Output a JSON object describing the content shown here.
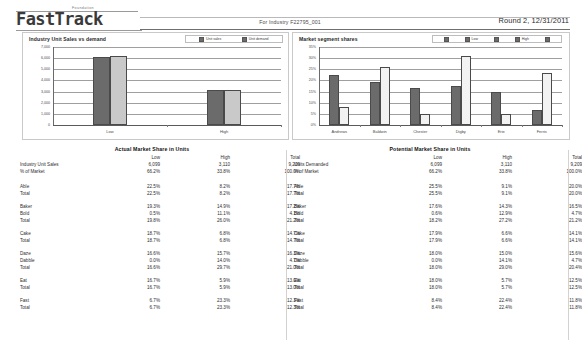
{
  "header": {
    "logo_superscript": "Foundation",
    "logo": "FastTrack",
    "industry": "For Industry F22795_001",
    "round": "Round 2, 12/31/2011"
  },
  "charts": {
    "left": {
      "title": "Industry Unit Sales vs demand",
      "legend": [
        {
          "label": "Unit sales",
          "color": "#6b6b6b"
        },
        {
          "label": "Unit demand",
          "color": "#c9c9c9"
        }
      ]
    },
    "right": {
      "title": "Market segment shares",
      "legend": [
        {
          "label": "",
          "color": "#6b6b6b"
        },
        {
          "label": "Low",
          "color": "#6b6b6b"
        },
        {
          "label": "",
          "color": "#f2f2f2"
        },
        {
          "label": "High",
          "color": "#f2f2f2"
        },
        {
          "label": "",
          "color": "#ffffff"
        }
      ]
    }
  },
  "chart_data": [
    {
      "type": "bar",
      "title": "Industry Unit Sales vs demand",
      "categories": [
        "Low",
        "High"
      ],
      "series": [
        {
          "name": "Unit sales",
          "values": [
            6099,
            3110
          ],
          "color": "#6b6b6b"
        },
        {
          "name": "Unit demand",
          "values": [
            6150,
            3130
          ],
          "color": "#c9c9c9"
        }
      ],
      "xlabel": "",
      "ylabel": "",
      "ylim": [
        0,
        7000
      ],
      "yticks": [
        "7,000",
        "6,000",
        "5,000",
        "4,000",
        "3,000",
        "2,000",
        "1,000",
        "0"
      ],
      "grid": true,
      "legend_position": "top-right"
    },
    {
      "type": "bar",
      "title": "Market segment shares",
      "categories": [
        "Andrews",
        "Baldwin",
        "Chester",
        "Digby",
        "Erie",
        "Ferris"
      ],
      "series": [
        {
          "name": "Low",
          "values": [
            22.5,
            19.3,
            16.7,
            17.6,
            15.0,
            6.7
          ],
          "color": "#6b6b6b"
        },
        {
          "name": "High",
          "values": [
            8.2,
            26.0,
            5.0,
            31.0,
            4.9,
            23.3
          ],
          "color": "#f2f2f2"
        }
      ],
      "xlabel": "",
      "ylabel": "",
      "ylim": [
        0,
        35
      ],
      "yticks": [
        "35%",
        "30%",
        "25%",
        "20%",
        "15%",
        "10%",
        "5%",
        "0%"
      ],
      "grid": true,
      "legend_position": "top-right"
    }
  ],
  "tables": {
    "actual": {
      "title": "Actual Market Share in Units",
      "columns": [
        "",
        "Low",
        "High",
        "Total"
      ],
      "summary": [
        {
          "label": "Industry Unit Sales",
          "low": "6,099",
          "high": "3,110",
          "total": "9,209"
        },
        {
          "label": "% of Market",
          "low": "66.2%",
          "high": "33.8%",
          "total": "100.0%"
        }
      ],
      "groups": [
        {
          "rows": [
            {
              "label": "Able",
              "low": "22.5%",
              "high": "8.2%",
              "total": "17.7%"
            },
            {
              "label": "Total",
              "low": "22.5%",
              "high": "8.2%",
              "total": "17.7%"
            }
          ]
        },
        {
          "rows": [
            {
              "label": "Baker",
              "low": "19.3%",
              "high": "14.9%",
              "total": "17.2%"
            },
            {
              "label": "Bold",
              "low": "0.5%",
              "high": "11.1%",
              "total": "4.1%"
            },
            {
              "label": "Total",
              "low": "19.8%",
              "high": "26.0%",
              "total": "21.2%"
            }
          ]
        },
        {
          "rows": [
            {
              "label": "Cake",
              "low": "18.7%",
              "high": "6.8%",
              "total": "14.7%"
            },
            {
              "label": "Total",
              "low": "18.7%",
              "high": "6.8%",
              "total": "14.7%"
            }
          ]
        },
        {
          "rows": [
            {
              "label": "Daze",
              "low": "16.6%",
              "high": "15.7%",
              "total": "16.3%"
            },
            {
              "label": "Dabble",
              "low": "0.0%",
              "high": "14.0%",
              "total": "4.7%"
            },
            {
              "label": "Total",
              "low": "16.6%",
              "high": "29.7%",
              "total": "21.0%"
            }
          ]
        },
        {
          "rows": [
            {
              "label": "Eat",
              "low": "16.7%",
              "high": "5.9%",
              "total": "13.0%"
            },
            {
              "label": "Total",
              "low": "16.7%",
              "high": "5.9%",
              "total": "13.0%"
            }
          ]
        },
        {
          "rows": [
            {
              "label": "Fast",
              "low": "6.7%",
              "high": "23.3%",
              "total": "12.3%"
            },
            {
              "label": "Total",
              "low": "6.7%",
              "high": "23.3%",
              "total": "12.3%"
            }
          ]
        }
      ]
    },
    "potential": {
      "title": "Potential Market Share in Units",
      "columns": [
        "",
        "Low",
        "High",
        "Total"
      ],
      "summary": [
        {
          "label": "Units Demanded",
          "low": "6,099",
          "high": "3,110",
          "total": "9,209"
        },
        {
          "label": "% of Market",
          "low": "66.2%",
          "high": "33.8%",
          "total": "100.0%"
        }
      ],
      "groups": [
        {
          "rows": [
            {
              "label": "Able",
              "low": "25.5%",
              "high": "9.1%",
              "total": "20.0%"
            },
            {
              "label": "Total",
              "low": "25.5%",
              "high": "9.1%",
              "total": "20.0%"
            }
          ]
        },
        {
          "rows": [
            {
              "label": "Baker",
              "low": "17.6%",
              "high": "14.3%",
              "total": "16.5%"
            },
            {
              "label": "Bold",
              "low": "0.6%",
              "high": "12.9%",
              "total": "4.7%"
            },
            {
              "label": "Total",
              "low": "18.2%",
              "high": "27.2%",
              "total": "21.2%"
            }
          ]
        },
        {
          "rows": [
            {
              "label": "Cake",
              "low": "17.9%",
              "high": "6.6%",
              "total": "14.1%"
            },
            {
              "label": "Total",
              "low": "17.9%",
              "high": "6.6%",
              "total": "14.1%"
            }
          ]
        },
        {
          "rows": [
            {
              "label": "Daze",
              "low": "18.0%",
              "high": "15.0%",
              "total": "15.6%"
            },
            {
              "label": "Dabble",
              "low": "0.0%",
              "high": "14.1%",
              "total": "4.7%"
            },
            {
              "label": "Total",
              "low": "18.0%",
              "high": "29.0%",
              "total": "20.4%"
            }
          ]
        },
        {
          "rows": [
            {
              "label": "Eat",
              "low": "18.0%",
              "high": "5.7%",
              "total": "12.5%"
            },
            {
              "label": "Total",
              "low": "18.0%",
              "high": "5.7%",
              "total": "12.5%"
            }
          ]
        },
        {
          "rows": [
            {
              "label": "Fast",
              "low": "8.4%",
              "high": "22.4%",
              "total": "11.8%"
            },
            {
              "label": "Total",
              "low": "8.4%",
              "high": "22.4%",
              "total": "11.8%"
            }
          ]
        }
      ]
    }
  }
}
